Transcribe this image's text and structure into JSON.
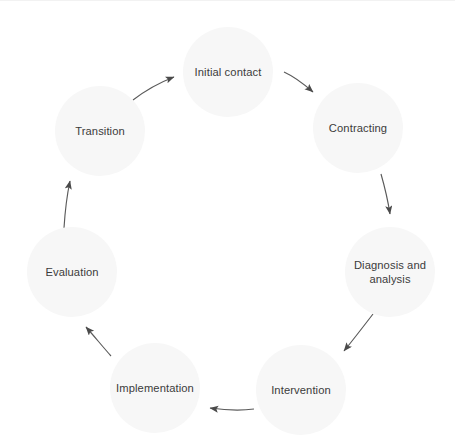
{
  "diagram": {
    "type": "cyclical-process-diagram",
    "title": "",
    "direction": "clockwise",
    "canvas": {
      "width": 455,
      "height": 445,
      "background": "#ffffff"
    },
    "style": {
      "node_fill": "#f7f7f7",
      "text_color": "#3b3b3b",
      "arrow_color": "#5a5a5a",
      "hairline_color": "#f2f2f2"
    },
    "nodes": [
      {
        "id": "initial-contact",
        "label": "Initial contact",
        "cx": 228,
        "cy": 72,
        "r": 45
      },
      {
        "id": "contracting",
        "label": "Contracting",
        "cx": 358,
        "cy": 128,
        "r": 45
      },
      {
        "id": "diagnosis-and-analysis",
        "label": "Diagnosis and\nanalysis",
        "cx": 390,
        "cy": 272,
        "r": 45
      },
      {
        "id": "intervention",
        "label": "Intervention",
        "cx": 301,
        "cy": 390,
        "r": 45
      },
      {
        "id": "implementation",
        "label": "Implementation",
        "cx": 155,
        "cy": 388,
        "r": 45
      },
      {
        "id": "evaluation",
        "label": "Evaluation",
        "cx": 72,
        "cy": 272,
        "r": 45
      },
      {
        "id": "transition",
        "label": "Transition",
        "cx": 100,
        "cy": 131,
        "r": 45
      }
    ],
    "arrows": [
      {
        "id": "arrow-transition-to-initial-contact",
        "from": "transition",
        "to": "initial-contact"
      },
      {
        "id": "arrow-initial-contact-to-contracting",
        "from": "initial-contact",
        "to": "contracting"
      },
      {
        "id": "arrow-contracting-to-diagnosis",
        "from": "contracting",
        "to": "diagnosis-and-analysis"
      },
      {
        "id": "arrow-diagnosis-to-intervention",
        "from": "diagnosis-and-analysis",
        "to": "intervention"
      },
      {
        "id": "arrow-intervention-to-implementation",
        "from": "intervention",
        "to": "implementation"
      },
      {
        "id": "arrow-implementation-to-evaluation",
        "from": "implementation",
        "to": "evaluation"
      },
      {
        "id": "arrow-evaluation-to-transition",
        "from": "evaluation",
        "to": "transition"
      }
    ]
  }
}
